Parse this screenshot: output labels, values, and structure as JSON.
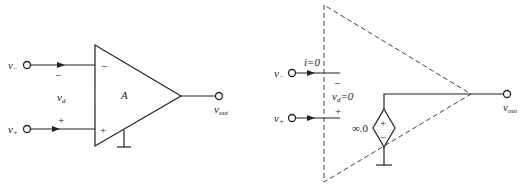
{
  "left_diagram": {
    "title": "Op-amp symbol",
    "inverting_input": {
      "label": "v",
      "sub": "−"
    },
    "noninverting_input": {
      "label": "v",
      "sub": "+"
    },
    "diff_voltage": {
      "label": "v",
      "sub": "d"
    },
    "diff_minus_sign": "−",
    "diff_plus_sign": "+",
    "gain_label": "A",
    "pin_minus": "−",
    "pin_plus": "+",
    "output": {
      "label": "v",
      "sub": "out"
    }
  },
  "right_diagram": {
    "title": "Ideal op-amp model",
    "inverting_input": {
      "label": "v",
      "sub": "−"
    },
    "noninverting_input": {
      "label": "v",
      "sub": "+"
    },
    "current_label": "i=0",
    "diff_voltage": {
      "label": "v",
      "sub": "d",
      "suffix": "=0"
    },
    "diff_minus_sign": "−",
    "diff_plus_sign": "+",
    "source_gain_label": "∞.0",
    "source_plus": "+",
    "source_minus": "−",
    "output": {
      "label": "v",
      "sub": "out"
    }
  },
  "colors": {
    "line": "#222222",
    "dashed": "#444444",
    "background": "#ffffff"
  }
}
